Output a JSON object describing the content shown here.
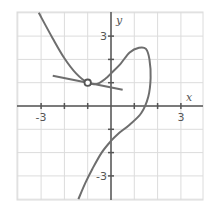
{
  "chart_data": {
    "type": "line",
    "title": "",
    "xlabel": "x",
    "ylabel": "y",
    "xlim": [
      -4,
      4
    ],
    "ylim": [
      -4,
      4
    ],
    "grid": true,
    "x_tick_labels": [
      {
        "value": -3,
        "label": "-3"
      },
      {
        "value": 3,
        "label": "3"
      }
    ],
    "y_tick_labels": [
      {
        "value": 3,
        "label": "3"
      },
      {
        "value": -3,
        "label": "-3"
      }
    ],
    "series": [
      {
        "name": "curve",
        "points": [
          [
            -3.1,
            4.0
          ],
          [
            -2.5,
            2.9
          ],
          [
            -2.0,
            2.05
          ],
          [
            -1.5,
            1.4
          ],
          [
            -1.0,
            1.0
          ],
          [
            -0.6,
            0.95
          ],
          [
            -0.2,
            1.2
          ],
          [
            0.0,
            1.4
          ],
          [
            0.4,
            1.8
          ],
          [
            0.8,
            2.3
          ],
          [
            1.2,
            2.5
          ],
          [
            1.5,
            2.45
          ],
          [
            1.65,
            2.0
          ],
          [
            1.7,
            1.2
          ],
          [
            1.6,
            0.4
          ],
          [
            1.3,
            -0.3
          ],
          [
            0.8,
            -0.8
          ],
          [
            0.3,
            -1.2
          ],
          [
            0.0,
            -1.5
          ],
          [
            -0.4,
            -2.0
          ],
          [
            -0.8,
            -2.7
          ],
          [
            -1.1,
            -3.3
          ],
          [
            -1.4,
            -4.0
          ]
        ]
      },
      {
        "name": "tangent-line",
        "points": [
          [
            -2.5,
            1.3
          ],
          [
            0.5,
            0.7
          ]
        ]
      }
    ],
    "annotations": [
      {
        "type": "point",
        "x": -1.0,
        "y": 1.0,
        "style": "open-circle"
      }
    ]
  },
  "colors": {
    "curve": "#6e6e6e",
    "grid": "#dcdcdc",
    "axis": "#555555"
  }
}
